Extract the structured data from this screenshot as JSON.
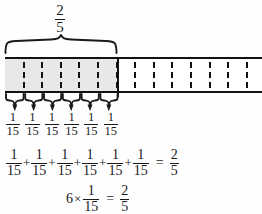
{
  "diagram": {
    "title_fraction": {
      "numerator": "2",
      "denominator": "5"
    },
    "bar": {
      "total_cells": 15,
      "shaded_cells": 6,
      "shaded_fill_color": "#e8e8e6",
      "outline_color": "#121212",
      "divider_style": "dashed"
    },
    "unit_labels": [
      {
        "numerator": "1",
        "denominator": "15"
      },
      {
        "numerator": "1",
        "denominator": "15"
      },
      {
        "numerator": "1",
        "denominator": "15"
      },
      {
        "numerator": "1",
        "denominator": "15"
      },
      {
        "numerator": "1",
        "denominator": "15"
      },
      {
        "numerator": "1",
        "denominator": "15"
      }
    ],
    "equation_sum": {
      "terms": [
        {
          "numerator": "1",
          "denominator": "15"
        },
        {
          "numerator": "1",
          "denominator": "15"
        },
        {
          "numerator": "1",
          "denominator": "15"
        },
        {
          "numerator": "1",
          "denominator": "15"
        },
        {
          "numerator": "1",
          "denominator": "15"
        },
        {
          "numerator": "1",
          "denominator": "15"
        }
      ],
      "plus": "+",
      "equals": "=",
      "result": {
        "numerator": "2",
        "denominator": "5"
      }
    },
    "equation_product": {
      "multiplier": "6",
      "times": "×",
      "factor": {
        "numerator": "1",
        "denominator": "15"
      },
      "equals": "=",
      "result": {
        "numerator": "2",
        "denominator": "5"
      }
    }
  }
}
